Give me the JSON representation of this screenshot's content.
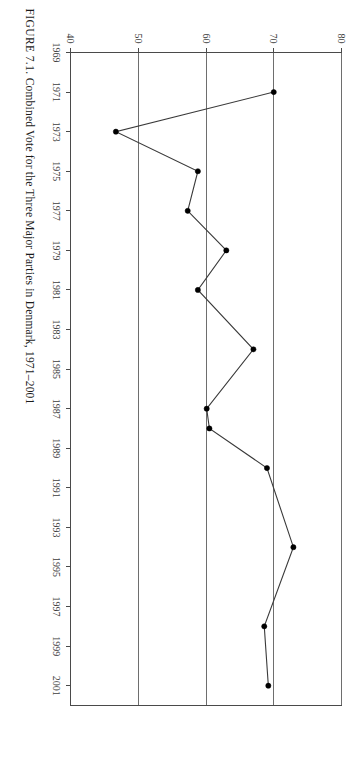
{
  "figure": {
    "caption_label": "FIGURE 7.1.",
    "caption_text": "Combined Vote for the Three Major Parties in Denmark, 1971–2001",
    "caption_full": "FIGURE 7.1. Combined Vote for the Three Major Parties in Denmark, 1971–2001",
    "orientation": "rotated-90-ccw",
    "background_color": "#ffffff",
    "line_color": "#3a3a3a",
    "marker_color": "#000000",
    "grid_color": "#6e6e6e"
  },
  "chart_data": {
    "type": "line",
    "title": "Combined Vote for the Three Major Parties in Denmark, 1971–2001",
    "xlabel": "",
    "ylabel": "",
    "grid": true,
    "legend": false,
    "legend_position": "none",
    "xlim": [
      1969,
      2002
    ],
    "ylim": [
      40,
      80
    ],
    "x_ticks": [
      1969,
      1971,
      1973,
      1975,
      1977,
      1979,
      1981,
      1983,
      1985,
      1987,
      1989,
      1991,
      1993,
      1995,
      1997,
      1999,
      2001
    ],
    "x_tick_labels": [
      "1969",
      "1971",
      "1973",
      "1975",
      "1977",
      "1979",
      "1981",
      "1983",
      "1985",
      "1987",
      "1989",
      "1991",
      "1993",
      "1995",
      "1997",
      "1999",
      "2001"
    ],
    "y_ticks": [
      40,
      50,
      60,
      70,
      80
    ],
    "y_tick_labels": [
      "40",
      "50",
      "60",
      "70",
      "80"
    ],
    "gridlines_y": [
      50,
      60,
      70,
      80
    ],
    "series": [
      {
        "name": "Combined vote share of three major parties",
        "x": [
          1971,
          1973,
          1975,
          1977,
          1979,
          1981,
          1984,
          1987,
          1988,
          1990,
          1994,
          1998,
          2001
        ],
        "values": [
          70.0,
          46.7,
          58.8,
          57.3,
          63.0,
          58.8,
          67.0,
          60.1,
          60.5,
          69.0,
          72.9,
          68.6,
          69.2
        ]
      }
    ]
  }
}
